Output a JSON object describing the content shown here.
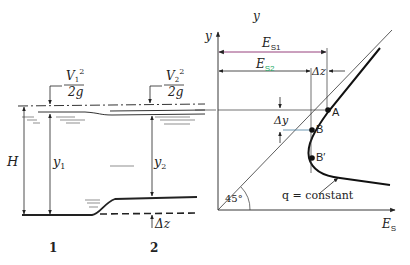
{
  "left_panel": {
    "velocity_head_1": {
      "num": "V",
      "sub": "1",
      "sup": "2",
      "den": "2g"
    },
    "velocity_head_2": {
      "num": "V",
      "sub": "2",
      "sup": "2",
      "den": "2g"
    },
    "total_head_label": "H",
    "depth_1": {
      "main": "y",
      "sub": "1"
    },
    "depth_2": {
      "main": "y",
      "sub": "2"
    },
    "step_label": "Δz",
    "section_1": "1",
    "section_2": "2"
  },
  "right_panel": {
    "top_label": "y",
    "y_axis_label": "y",
    "x_axis_label": {
      "main": "E",
      "sub": "S"
    },
    "es1": {
      "main": "E",
      "sub": "S1"
    },
    "es2": {
      "main": "E",
      "sub": "S2"
    },
    "dz_label": "Δz",
    "dy_label": "Δy",
    "points": [
      "A",
      "B",
      "B′"
    ],
    "angle_label": "45°",
    "curve_label": "q = constant"
  }
}
